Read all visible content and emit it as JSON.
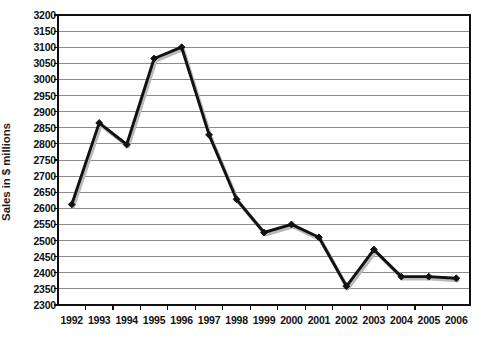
{
  "chart_data": {
    "type": "line",
    "title": "",
    "xlabel": "",
    "ylabel": "Sales in $ millions",
    "categories": [
      "1992",
      "1993",
      "1994",
      "1995",
      "1996",
      "1997",
      "1998",
      "1999",
      "2000",
      "2001",
      "2002",
      "2003",
      "2004",
      "2005",
      "2006"
    ],
    "values": [
      2612,
      2865,
      2798,
      3065,
      3100,
      2828,
      2628,
      2525,
      2550,
      2510,
      2358,
      2472,
      2388,
      2388,
      2383
    ],
    "series": [
      {
        "name": "Sales",
        "values": [
          2612,
          2865,
          2798,
          3065,
          3100,
          2828,
          2628,
          2525,
          2550,
          2510,
          2358,
          2472,
          2388,
          2388,
          2383
        ]
      }
    ],
    "ylim": [
      2300,
      3200
    ],
    "ytick_step": 50,
    "yticks": [
      3200,
      3150,
      3100,
      3050,
      3000,
      2950,
      2900,
      2850,
      2800,
      2750,
      2700,
      2650,
      2600,
      2550,
      2500,
      2450,
      2400,
      2350,
      2300
    ],
    "grid": true,
    "grid_axis": "y",
    "legend": "none",
    "marker": "diamond",
    "line_color": "#111111",
    "grid_color": "#8c8c8c",
    "axis_color": "#111111",
    "background_color": "#ffffff"
  },
  "layout": {
    "plot_left": 58,
    "plot_right": 470,
    "plot_top": 15,
    "plot_bottom": 305
  }
}
